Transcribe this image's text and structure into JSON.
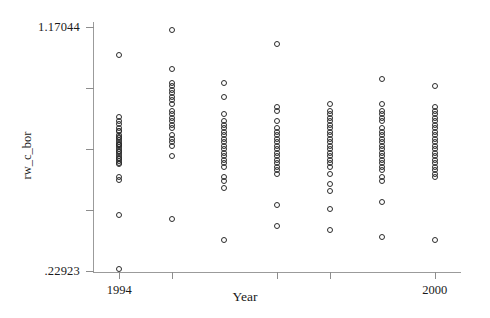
{
  "chart_data": {
    "type": "scatter",
    "title": "",
    "xlabel": "Year",
    "ylabel": "rw_c_bor",
    "xlim": [
      1993.5,
      2000.5
    ],
    "ylim": [
      0.22923,
      1.17044
    ],
    "grid": false,
    "legend": null,
    "y_tick_labels": [
      "1.17044",
      ".22923"
    ],
    "y_tick_values": [
      1.17044,
      0.22923
    ],
    "x_tick_labels": [
      "1994",
      "2000"
    ],
    "x_tick_values": [
      1994,
      2000
    ],
    "marker": "open-circle",
    "marker_color": "#2b2b2b",
    "axis_color": "#9b9b9b",
    "series": [
      {
        "name": "rw_c_bor",
        "categories": [
          1994,
          1995,
          1996,
          1997,
          1998,
          1999,
          2000
        ],
        "points_by_year": {
          "1994": [
            1.064,
            0.8215,
            0.808,
            0.7945,
            0.781,
            0.7675,
            0.7675,
            0.754,
            0.747,
            0.7405,
            0.734,
            0.727,
            0.7205,
            0.714,
            0.714,
            0.707,
            0.7005,
            0.694,
            0.687,
            0.6805,
            0.674,
            0.667,
            0.6605,
            0.654,
            0.647,
            0.6405,
            0.593,
            0.5795,
            0.444,
            0.236
          ],
          "1995": [
            1.159,
            1.01,
            0.956,
            0.9425,
            0.929,
            0.9155,
            0.902,
            0.8885,
            0.875,
            0.848,
            0.8345,
            0.821,
            0.8075,
            0.794,
            0.7805,
            0.7535,
            0.74,
            0.7265,
            0.713,
            0.6725,
            0.429
          ],
          "1996": [
            0.956,
            0.902,
            0.8345,
            0.8075,
            0.794,
            0.7805,
            0.767,
            0.7535,
            0.74,
            0.7265,
            0.713,
            0.6995,
            0.686,
            0.6725,
            0.659,
            0.6455,
            0.632,
            0.5915,
            0.578,
            0.551,
            0.348
          ],
          "1997": [
            1.105,
            0.8615,
            0.848,
            0.8075,
            0.7805,
            0.767,
            0.7535,
            0.74,
            0.7265,
            0.713,
            0.6995,
            0.686,
            0.6725,
            0.659,
            0.6455,
            0.632,
            0.6185,
            0.605,
            0.483,
            0.402
          ],
          "1998": [
            0.875,
            0.848,
            0.8345,
            0.821,
            0.8075,
            0.794,
            0.7805,
            0.767,
            0.7535,
            0.74,
            0.7265,
            0.713,
            0.6995,
            0.686,
            0.6725,
            0.659,
            0.6455,
            0.632,
            0.605,
            0.5645,
            0.5375,
            0.47,
            0.3885
          ],
          "1999": [
            0.9695,
            0.875,
            0.848,
            0.8345,
            0.821,
            0.8075,
            0.7805,
            0.767,
            0.7535,
            0.74,
            0.7265,
            0.713,
            0.6995,
            0.686,
            0.6725,
            0.659,
            0.6455,
            0.632,
            0.6185,
            0.5915,
            0.578,
            0.4965,
            0.3615
          ],
          "2000": [
            0.9425,
            0.8615,
            0.848,
            0.8345,
            0.821,
            0.8075,
            0.794,
            0.7805,
            0.767,
            0.7535,
            0.74,
            0.7265,
            0.713,
            0.6995,
            0.686,
            0.6725,
            0.659,
            0.6455,
            0.632,
            0.6185,
            0.605,
            0.5915,
            0.348
          ]
        }
      }
    ]
  },
  "axes": {
    "y_label": "rw_c_bor",
    "x_label": "Year",
    "y_max_label": "1.17044",
    "y_min_label": ".22923",
    "x_min_label": "1994",
    "x_max_label": "2000"
  }
}
